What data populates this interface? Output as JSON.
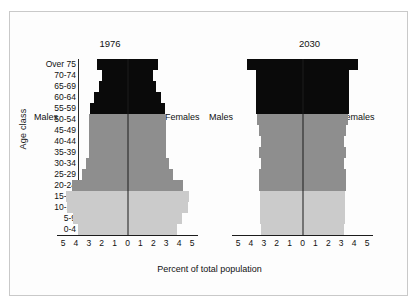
{
  "figure": {
    "x_axis_title": "Percent of total population",
    "y_axis_title": "Age class",
    "age_classes": [
      "Over 75",
      "70-74",
      "65-69",
      "60-64",
      "55-59",
      "50-54",
      "45-49",
      "40-44",
      "35-39",
      "30-34",
      "25-29",
      "20-24",
      "15-19",
      "10-14",
      "5-9",
      "0-4"
    ],
    "tick_labels": [
      "5",
      "4",
      "3",
      "2",
      "1",
      "0",
      "1",
      "2",
      "3",
      "4",
      "5"
    ],
    "axis_min": -5,
    "axis_max": 5,
    "colors": {
      "elderly": "#0a0a0a",
      "adult": "#8e8e8e",
      "youth": "#cbcbcb",
      "axis": "#1c1c1c",
      "frame": "#c9c9c9"
    },
    "side_labels": {
      "male": "Males",
      "female": "Females"
    }
  },
  "chart_data": [
    {
      "type": "bar",
      "title": "1976",
      "xlabel": "Percent of total population",
      "ylabel": "Age class",
      "xlim": [
        -5,
        5
      ],
      "grid": false,
      "legend": "none",
      "orientation": "population-pyramid",
      "categories": [
        "Over 75",
        "70-74",
        "65-69",
        "60-64",
        "55-59",
        "50-54",
        "45-49",
        "40-44",
        "35-39",
        "30-34",
        "25-29",
        "20-24",
        "15-19",
        "10-14",
        "5-9",
        "0-4"
      ],
      "band_by_category": [
        "elderly",
        "elderly",
        "elderly",
        "elderly",
        "elderly",
        "adult",
        "adult",
        "adult",
        "adult",
        "adult",
        "adult",
        "adult",
        "youth",
        "youth",
        "youth",
        "youth"
      ],
      "series": [
        {
          "name": "Males",
          "values": [
            2.4,
            2.0,
            2.2,
            2.6,
            2.9,
            3.0,
            3.0,
            3.0,
            3.0,
            3.2,
            3.5,
            4.3,
            4.8,
            4.7,
            4.2,
            3.8
          ]
        },
        {
          "name": "Females",
          "values": [
            2.4,
            2.0,
            2.2,
            2.6,
            2.9,
            3.0,
            3.0,
            3.0,
            3.0,
            3.2,
            3.5,
            4.3,
            4.8,
            4.7,
            4.2,
            3.8
          ]
        }
      ]
    },
    {
      "type": "bar",
      "title": "2030",
      "xlabel": "Percent of total population",
      "ylabel": "Age class",
      "xlim": [
        -5,
        5
      ],
      "grid": false,
      "legend": "none",
      "orientation": "population-pyramid",
      "categories": [
        "Over 75",
        "70-74",
        "65-69",
        "60-64",
        "55-59",
        "50-54",
        "45-49",
        "40-44",
        "35-39",
        "30-34",
        "25-29",
        "20-24",
        "15-19",
        "10-14",
        "5-9",
        "0-4"
      ],
      "band_by_category": [
        "elderly",
        "elderly",
        "elderly",
        "elderly",
        "elderly",
        "adult",
        "adult",
        "adult",
        "adult",
        "adult",
        "adult",
        "adult",
        "youth",
        "youth",
        "youth",
        "youth"
      ],
      "series": [
        {
          "name": "Males",
          "values": [
            4.3,
            3.6,
            3.6,
            3.6,
            3.6,
            3.5,
            3.4,
            3.2,
            3.4,
            3.2,
            3.4,
            3.4,
            3.3,
            3.3,
            3.3,
            3.2
          ]
        },
        {
          "name": "Females",
          "values": [
            4.3,
            3.6,
            3.6,
            3.6,
            3.6,
            3.5,
            3.4,
            3.2,
            3.4,
            3.2,
            3.4,
            3.4,
            3.3,
            3.3,
            3.3,
            3.2
          ]
        }
      ]
    }
  ]
}
